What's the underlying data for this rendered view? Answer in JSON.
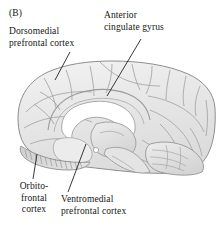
{
  "figure": {
    "panel_letter": "(B)",
    "view": "midsagittal section of the human brain",
    "background_color": "#ffffff",
    "brain_fill_color": "#e9e9e9",
    "brain_outline_color": "#8c8c8c",
    "sulcus_line_color": "#a6a6a6",
    "corpus_callosum_color": "#ffffff",
    "leader_line_color": "#222222",
    "text_color": "#161616"
  },
  "labels": {
    "dorsomedial": "Dorsomedial\nprefrontal cortex",
    "anterior_cingulate": "Anterior\ncingulate gyrus",
    "orbitofrontal": "Orbito-\nfrontal\ncortex",
    "ventromedial": "Ventromedial\nprefrontal cortex"
  },
  "leader_lines": [
    {
      "name": "dorsomedial-leader",
      "x1": 70,
      "y1": 52,
      "x2": 55,
      "y2": 80
    },
    {
      "name": "anterior-cingulate-leader",
      "x1": 141,
      "y1": 39,
      "x2": 107,
      "y2": 96
    },
    {
      "name": "orbitofrontal-leader",
      "x1": 37,
      "y1": 154,
      "x2": 33,
      "y2": 179
    },
    {
      "name": "ventromedial-leader",
      "x1": 86,
      "y1": 144,
      "x2": 68,
      "y2": 192
    }
  ]
}
